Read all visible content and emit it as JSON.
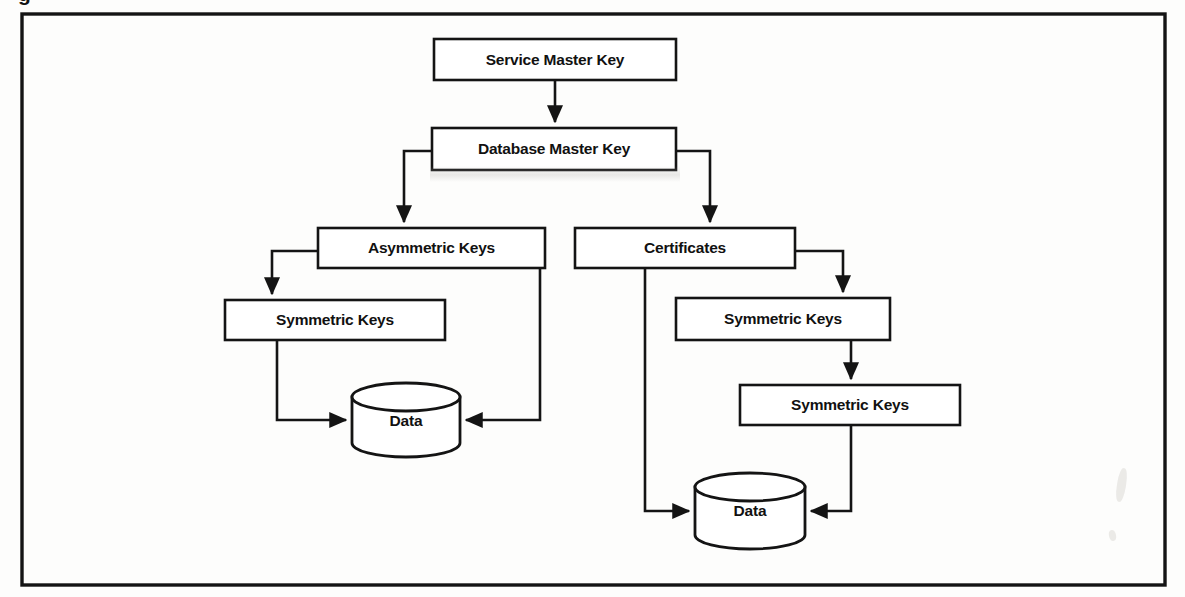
{
  "figure": {
    "caption_fragment": "g",
    "frame": {
      "x": 22,
      "y": 14,
      "width": 1143,
      "height": 571,
      "border_color": "#141414"
    },
    "background_color": "#fdfdfc",
    "line_color": "#141414"
  },
  "nodes": [
    {
      "id": "service-master-key",
      "label": "Service Master Key",
      "type": "process",
      "x": 434,
      "y": 39,
      "width": 242,
      "height": 41
    },
    {
      "id": "database-master-key",
      "label": "Database Master Key",
      "type": "process",
      "x": 432,
      "y": 128,
      "width": 244,
      "height": 42
    },
    {
      "id": "asymmetric-keys",
      "label": "Asymmetric Keys",
      "type": "process",
      "x": 318,
      "y": 228,
      "width": 227,
      "height": 40
    },
    {
      "id": "certificates",
      "label": "Certificates",
      "type": "process",
      "x": 575,
      "y": 228,
      "width": 220,
      "height": 40
    },
    {
      "id": "symmetric-keys-left",
      "label": "Symmetric Keys",
      "type": "process",
      "x": 225,
      "y": 300,
      "width": 220,
      "height": 40
    },
    {
      "id": "symmetric-keys-right-upper",
      "label": "Symmetric Keys",
      "type": "process",
      "x": 676,
      "y": 298,
      "width": 214,
      "height": 42
    },
    {
      "id": "symmetric-keys-right-lower",
      "label": "Symmetric Keys",
      "type": "process",
      "x": 740,
      "y": 385,
      "width": 220,
      "height": 40
    },
    {
      "id": "data-store-left",
      "label": "Data",
      "type": "datastore",
      "x": 352,
      "y": 383,
      "width": 108,
      "height": 74
    },
    {
      "id": "data-store-right",
      "label": "Data",
      "type": "datastore",
      "x": 695,
      "y": 473,
      "width": 110,
      "height": 76
    }
  ],
  "edges": [
    {
      "id": "smk-to-dmk",
      "from": "service-master-key",
      "to": "database-master-key",
      "arrow": true
    },
    {
      "id": "dmk-to-asymmetric",
      "from": "database-master-key",
      "to": "asymmetric-keys",
      "arrow": true
    },
    {
      "id": "dmk-to-certificates",
      "from": "database-master-key",
      "to": "certificates",
      "arrow": true
    },
    {
      "id": "asymmetric-to-symmetric-left",
      "from": "asymmetric-keys",
      "to": "symmetric-keys-left",
      "arrow": true
    },
    {
      "id": "symmetric-left-to-data",
      "from": "symmetric-keys-left",
      "to": "data-store-left",
      "arrow": true
    },
    {
      "id": "asymmetric-to-data",
      "from": "asymmetric-keys",
      "to": "data-store-left",
      "arrow": true
    },
    {
      "id": "certificates-to-symmetric-upper",
      "from": "certificates",
      "to": "symmetric-keys-right-upper",
      "arrow": true
    },
    {
      "id": "symmetric-upper-to-symmetric-lower",
      "from": "symmetric-keys-right-upper",
      "to": "symmetric-keys-right-lower",
      "arrow": true
    },
    {
      "id": "symmetric-lower-to-data",
      "from": "symmetric-keys-right-lower",
      "to": "data-store-right",
      "arrow": true
    },
    {
      "id": "certificates-to-data",
      "from": "certificates",
      "to": "data-store-right",
      "arrow": true
    }
  ],
  "labels": {
    "service_master_key": "Service Master Key",
    "database_master_key": "Database Master Key",
    "asymmetric_keys": "Asymmetric Keys",
    "certificates": "Certificates",
    "symmetric_keys_left": "Symmetric Keys",
    "symmetric_keys_right_upper": "Symmetric Keys",
    "symmetric_keys_right_lower": "Symmetric Keys",
    "data_left": "Data",
    "data_right": "Data"
  }
}
